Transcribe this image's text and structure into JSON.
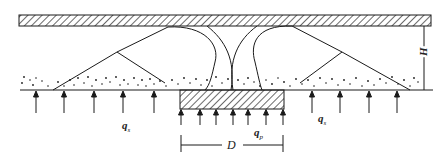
{
  "diagram": {
    "type": "soil-arching-schematic",
    "labels": {
      "H": "H",
      "D": "D",
      "qs_left": "q",
      "qs_left_sub": "s",
      "qs_right": "q",
      "qs_right_sub": "s",
      "qp": "q",
      "qp_sub": "p"
    },
    "elements": {
      "top_slab": "hatched rigid slab",
      "pile_cap": "hatched pile cap of width D",
      "soil_layer": "granular fill (stippled)",
      "arch_lines": "soil arching / failure lines",
      "upward_arrows_soil_left": 5,
      "upward_arrows_soil_right": 4,
      "upward_arrows_pile": 7
    },
    "colors": {
      "line": "#1a1a1a",
      "background": "#ffffff"
    }
  }
}
